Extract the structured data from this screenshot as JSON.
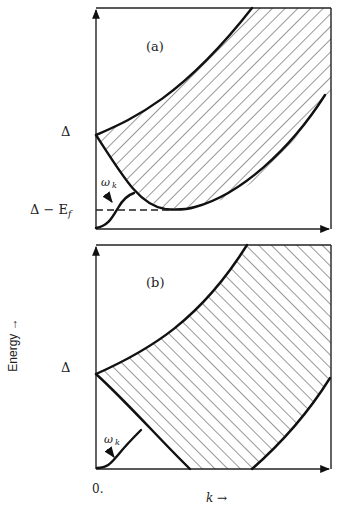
{
  "figure": {
    "y_axis_label": "Energy →",
    "x_axis_label": "k →",
    "origin_label": "0.",
    "panels": [
      {
        "id": "a",
        "label": "(a)",
        "y_ticks": [
          {
            "label": "Δ",
            "role": "gap"
          },
          {
            "label": "Δ − E",
            "sub": "f",
            "role": "gap-minus-binding-energy"
          }
        ],
        "curve_label": "ω",
        "curve_label_sub": "k",
        "description": "Hatched two-particle continuum bounded above by rising edge starting at Δ and below by edge dipping to Δ − E_f; bound mode ω_k rises from 0 crossing dashed line at Δ − E_f"
      },
      {
        "id": "b",
        "label": "(b)",
        "y_ticks": [
          {
            "label": "Δ",
            "role": "gap"
          }
        ],
        "curve_label": "ω",
        "curve_label_sub": "k",
        "description": "Hatched continuum bounded above by rising edge from Δ and below by edge falling linearly to zero energy; bound mode ω_k rises from origin"
      }
    ]
  }
}
